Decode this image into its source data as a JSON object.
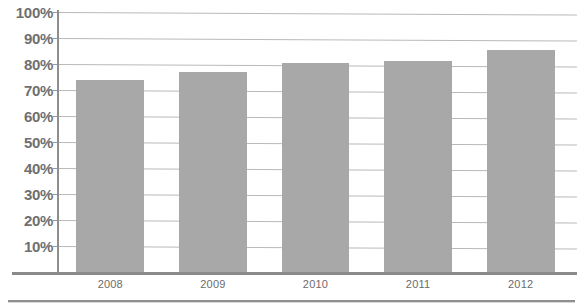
{
  "chart_data": {
    "type": "bar",
    "title": "",
    "subtitle": "",
    "xlabel": "",
    "ylabel": "",
    "categories": [
      "2008",
      "2009",
      "2010",
      "2011",
      "2012"
    ],
    "values": [
      74,
      77,
      80.5,
      81,
      85.5
    ],
    "series": [
      {
        "name": "",
        "values": [
          74,
          77,
          80.5,
          81,
          85.5
        ]
      }
    ],
    "ylim": [
      0,
      100
    ],
    "y_tick_labels": [
      "100%",
      "90%",
      "80%",
      "70%",
      "60%",
      "50%",
      "40%",
      "30%",
      "20%",
      "10%"
    ],
    "y_tick_values": [
      100,
      90,
      80,
      70,
      60,
      50,
      40,
      30,
      20,
      10
    ],
    "x_tick_labels": [
      "2008",
      "2009",
      "2010",
      "2011",
      "2012"
    ],
    "grid": true,
    "grid_axis": "y",
    "legend": false,
    "legend_position": "none",
    "annotations": [],
    "colors": {
      "bar_fill": "#a8a8a8",
      "gridline": "#b9b9b9",
      "axis_line": "#8e8e8e",
      "label_text": "#6f6f6f",
      "category_text": "#6b6b6b",
      "background": "#ffffff"
    }
  },
  "title_remnant": {
    "text": ""
  }
}
